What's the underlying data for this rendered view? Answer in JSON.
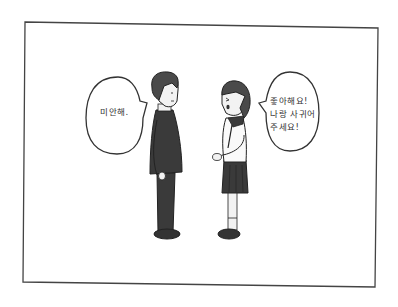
{
  "panel": {
    "type": "comic-panel",
    "colors": {
      "background": "#ffffff",
      "ink": "#333333",
      "clothing": "#3a3a3a",
      "hair": "#4a4a4a",
      "skin": "#f2f2f2"
    }
  },
  "characters": [
    {
      "id": "boy",
      "description": "boy in dark school uniform, facing right"
    },
    {
      "id": "girl",
      "description": "girl in sailor uniform with dark pleated skirt, facing left"
    }
  ],
  "speech_bubbles": [
    {
      "speaker": "boy",
      "lines": [
        "미안해."
      ]
    },
    {
      "speaker": "girl",
      "lines": [
        "좋아해요!",
        "나랑 사귀어",
        "주세요!"
      ]
    }
  ]
}
